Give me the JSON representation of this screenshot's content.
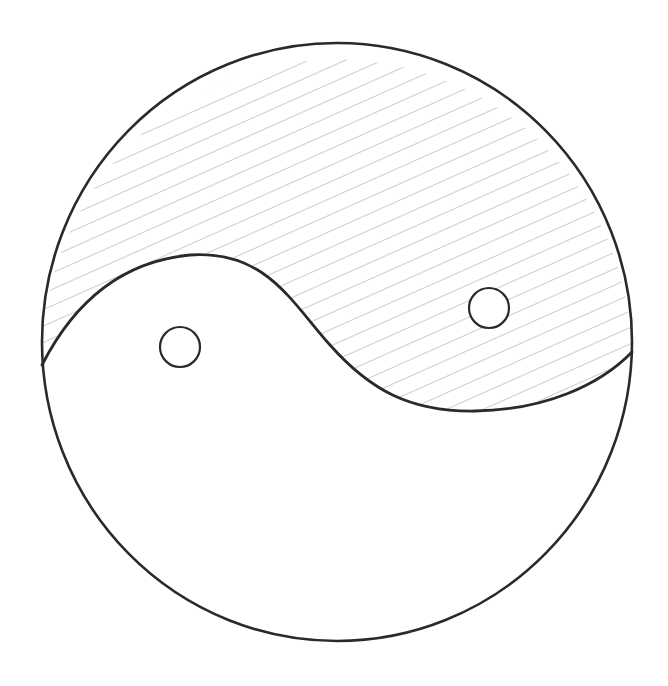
{
  "canvas": {
    "width": 668,
    "height": 686,
    "background": "#ffffff"
  },
  "drawing": {
    "subject": "hand-drawn yin-yang symbol",
    "stroke_color": "#2a2a2a",
    "hatch_color": "#9a9a9a",
    "outer_circle": {
      "cx": 337,
      "cy": 342,
      "rx": 295,
      "ry": 299,
      "stroke_width": 2.6
    },
    "divider_path": "M 42 365 C 70 310, 115 262, 190 255 C 265 250, 290 300, 330 345 C 370 390, 410 412, 475 411 C 545 410, 600 385, 632 352",
    "hatched_region_path": "M 42 365 C 70 310, 115 262, 190 255 C 265 250, 290 300, 330 345 C 370 390, 410 412, 475 411 C 545 410, 600 385, 632 352 A 295 299 0 0 0 42 365 Z",
    "hatch": {
      "slope_deg": -24,
      "spacing": 15,
      "stroke_width": 1
    },
    "dots": [
      {
        "name": "left-eye-dot",
        "cx": 180,
        "cy": 347,
        "r": 20
      },
      {
        "name": "right-eye-dot",
        "cx": 489,
        "cy": 308,
        "r": 20
      }
    ]
  }
}
